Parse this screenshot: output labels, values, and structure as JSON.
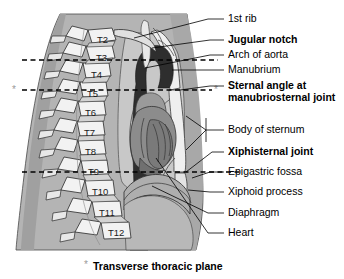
{
  "figure": {
    "title_caption": "Transverse thoracic plane",
    "caption_marker": "*",
    "plane_marker_left": "*",
    "plane_marker_right": "*"
  },
  "vertebrae": [
    {
      "label": "T2",
      "x": 97,
      "y": 43
    },
    {
      "label": "T3",
      "x": 96,
      "y": 61
    },
    {
      "label": "T4",
      "x": 91,
      "y": 78
    },
    {
      "label": "T5",
      "x": 87,
      "y": 97
    },
    {
      "label": "T6",
      "x": 85,
      "y": 116
    },
    {
      "label": "T7",
      "x": 84,
      "y": 136
    },
    {
      "label": "T8",
      "x": 85,
      "y": 155
    },
    {
      "label": "T9",
      "x": 88,
      "y": 175
    },
    {
      "label": "T10",
      "x": 92,
      "y": 195
    },
    {
      "label": "T11",
      "x": 99,
      "y": 216
    },
    {
      "label": "T12",
      "x": 108,
      "y": 236
    }
  ],
  "labels": [
    {
      "id": "first-rib",
      "text": "1st rib",
      "x": 228,
      "y": 22,
      "bold": false
    },
    {
      "id": "jugular-notch",
      "text": "Jugular notch",
      "x": 228,
      "y": 43,
      "bold": true
    },
    {
      "id": "arch-of-aorta",
      "text": "Arch of aorta",
      "x": 228,
      "y": 58,
      "bold": false
    },
    {
      "id": "manubrium",
      "text": "Manubrium",
      "x": 228,
      "y": 73,
      "bold": false
    },
    {
      "id": "sternal-angle-l1",
      "text": "Sternal angle at",
      "x": 228,
      "y": 89,
      "bold": true
    },
    {
      "id": "sternal-angle-l2",
      "text": "manubriosternal joint",
      "x": 228,
      "y": 101,
      "bold": true
    },
    {
      "id": "body-of-sternum",
      "text": "Body of sternum",
      "x": 228,
      "y": 133,
      "bold": false
    },
    {
      "id": "xiphisternal-joint",
      "text": "Xiphisternal joint",
      "x": 228,
      "y": 155,
      "bold": true
    },
    {
      "id": "epigastric-fossa",
      "text": "Epigastric fossa",
      "x": 228,
      "y": 175,
      "bold": false
    },
    {
      "id": "xiphoid-process",
      "text": "Xiphoid process",
      "x": 228,
      "y": 195,
      "bold": false
    },
    {
      "id": "diaphragm",
      "text": "Diaphragm",
      "x": 228,
      "y": 216,
      "bold": false
    },
    {
      "id": "heart",
      "text": "Heart",
      "x": 228,
      "y": 236,
      "bold": false
    }
  ],
  "planes": [
    {
      "id": "plane-t3",
      "y": 60,
      "x1": 22,
      "x2": 218,
      "has_markers": false
    },
    {
      "id": "plane-t5",
      "y": 90,
      "x1": 22,
      "x2": 212,
      "has_markers": true
    },
    {
      "id": "plane-t9",
      "y": 172,
      "x1": 22,
      "x2": 240,
      "has_markers": false
    }
  ],
  "colors": {
    "background": "#ffffff",
    "body_soft_tissue": "#b4b4b4",
    "bone_light": "#f0f0f0",
    "bone_mid": "#d2d2d2",
    "aorta_dark": "#2e2e2e",
    "heart_mid": "#9a9a9a",
    "heart_dark": "#7a7a7a",
    "lung_light": "#c8c8c8",
    "outline": "#333333",
    "text": "#000000",
    "marker_gray": "#9a9a9a"
  },
  "structures": [
    {
      "id": "body-outline",
      "name": "body-soft-tissue"
    },
    {
      "id": "vertebral-column",
      "name": "thoracic-vertebrae"
    },
    {
      "id": "aorta",
      "name": "aortic-arch-and-descending-aorta"
    },
    {
      "id": "heart",
      "name": "heart"
    },
    {
      "id": "sternum",
      "name": "sternum"
    },
    {
      "id": "diaphragm",
      "name": "diaphragm"
    },
    {
      "id": "trachea",
      "name": "trachea"
    }
  ]
}
